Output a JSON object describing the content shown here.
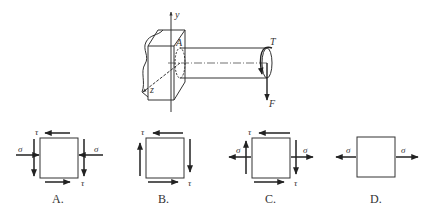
{
  "figure": {
    "main": {
      "axis_y_label": "y",
      "axis_z_label": "z",
      "point_label": "A",
      "torque_label": "T",
      "force_label": "F"
    },
    "options": [
      {
        "label": "A.",
        "tau": "τ",
        "sigma": "σ",
        "description": "compressive sigma, shear tau (left down, right down)"
      },
      {
        "label": "B.",
        "tau": "τ",
        "description": "pure shear tau"
      },
      {
        "label": "C.",
        "tau": "τ",
        "sigma": "σ",
        "description": "tensile sigma with shear tau"
      },
      {
        "label": "D.",
        "sigma": "σ",
        "description": "pure tension sigma"
      }
    ]
  },
  "colors": {
    "line": "#333333",
    "arrow": "#222222",
    "background": "#ffffff"
  }
}
